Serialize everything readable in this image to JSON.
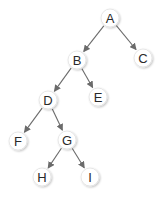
{
  "diagram": {
    "type": "binary-tree",
    "colors": {
      "edge": "#6b6b6b",
      "node_fill": "#ffffff",
      "node_stroke": "#e2e2e2",
      "text": "#2a2a2a"
    },
    "nodes": [
      {
        "id": "A",
        "label": "A",
        "x": 110,
        "y": 18
      },
      {
        "id": "B",
        "label": "B",
        "x": 77,
        "y": 60
      },
      {
        "id": "C",
        "label": "C",
        "x": 143,
        "y": 58
      },
      {
        "id": "D",
        "label": "D",
        "x": 48,
        "y": 100
      },
      {
        "id": "E",
        "label": "E",
        "x": 98,
        "y": 97
      },
      {
        "id": "F",
        "label": "F",
        "x": 18,
        "y": 141
      },
      {
        "id": "G",
        "label": "G",
        "x": 67,
        "y": 140
      },
      {
        "id": "H",
        "label": "H",
        "x": 42,
        "y": 177
      },
      {
        "id": "I",
        "label": "I",
        "x": 90,
        "y": 177
      }
    ],
    "edges": [
      {
        "from": "A",
        "to": "B"
      },
      {
        "from": "A",
        "to": "C"
      },
      {
        "from": "B",
        "to": "D"
      },
      {
        "from": "B",
        "to": "E"
      },
      {
        "from": "D",
        "to": "F"
      },
      {
        "from": "D",
        "to": "G"
      },
      {
        "from": "G",
        "to": "H"
      },
      {
        "from": "G",
        "to": "I"
      }
    ]
  }
}
